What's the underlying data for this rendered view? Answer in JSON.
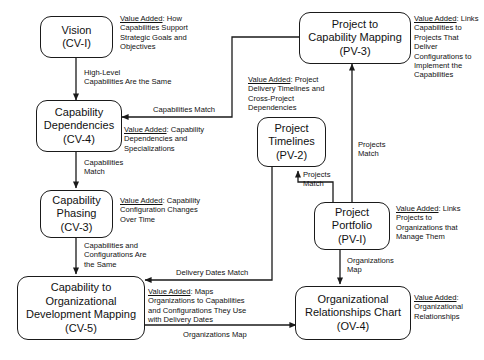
{
  "diagram": {
    "stroke_color": "#1a1a1a",
    "background": "#ffffff"
  },
  "nodes": [
    {
      "id": "cv1",
      "lines": [
        "Vision",
        "(CV-I)"
      ]
    },
    {
      "id": "cv4",
      "lines": [
        "Capability",
        "Dependencies",
        "(CV-4)"
      ]
    },
    {
      "id": "cv3",
      "lines": [
        "Capability",
        "Phasing",
        "(CV-3)"
      ]
    },
    {
      "id": "cv5",
      "lines": [
        "Capability to",
        "Organizational",
        "Development Mapping",
        "(CV-5)"
      ]
    },
    {
      "id": "pv3",
      "lines": [
        "Project to",
        "Capability Mapping",
        "(PV-3)"
      ]
    },
    {
      "id": "pv2",
      "lines": [
        "Project",
        "Timelines",
        "(PV-2)"
      ]
    },
    {
      "id": "pv1",
      "lines": [
        "Project",
        "Portfolio",
        "(PV-I)"
      ]
    },
    {
      "id": "ov4",
      "lines": [
        "Organizational",
        "Relationships Chart",
        "(OV-4)"
      ]
    }
  ],
  "edge_labels": {
    "cv1_cv4": "High-Level\nCapabilities Are the Same",
    "cv4_cv3": "Capabilities\nMatch",
    "cv3_cv5": "Capabilities and\nConfigurations Are\nthe Same",
    "pv3_cv4": "Capabilities Match",
    "pv2_cv5": "Delivery Dates Match",
    "pv1_pv2": "Projects\nMatch",
    "pv1_pv3": "Projects\nMatch",
    "pv1_ov4": "Organizations\nMap",
    "cv5_ov4": "Organizations Map"
  },
  "value_added": {
    "key": "Value Added",
    "cv1": ": How\nCapabilities Support\nStrategic Goals and\nObjectives",
    "cv4": ": Capability\nDependencies and\nSpecializations",
    "cv3": ": Capability\nConfiguration Changes\nOver Time",
    "cv5": ": Maps\nOrganizations to Capabilities\nand Configurations They Use\nwith Delivery Dates",
    "pv3": ": Links\nCapabilities to\nProjects That\nDeliver\nConfigurations to\nImplement the\nCapabilities",
    "pv2": ": Project\nDelivery Timelines and\nCross-Project\nDependencies",
    "pv1": ": Links\nProjects to\nOrganizations that\nManage Them",
    "ov4": ":\nOrganizational\nRelationships"
  }
}
